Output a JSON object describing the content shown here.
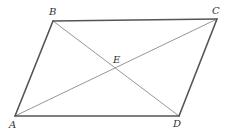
{
  "figure": {
    "type": "parallelogram",
    "points": {
      "A": {
        "label": "A",
        "x": 15,
        "y": 116
      },
      "B": {
        "label": "B",
        "x": 53,
        "y": 21
      },
      "C": {
        "label": "C",
        "x": 217,
        "y": 19
      },
      "D": {
        "label": "D",
        "x": 179,
        "y": 116
      },
      "E": {
        "label": "E",
        "x": 116,
        "y": 68
      }
    },
    "sides": [
      "AB",
      "BC",
      "CD",
      "DA"
    ],
    "diagonals": [
      "AC",
      "BD"
    ],
    "intersection": "E",
    "colors": {
      "side": "#555555",
      "diagonal": "#8a8a8a",
      "label": "#333333",
      "background": "#ffffff"
    }
  }
}
